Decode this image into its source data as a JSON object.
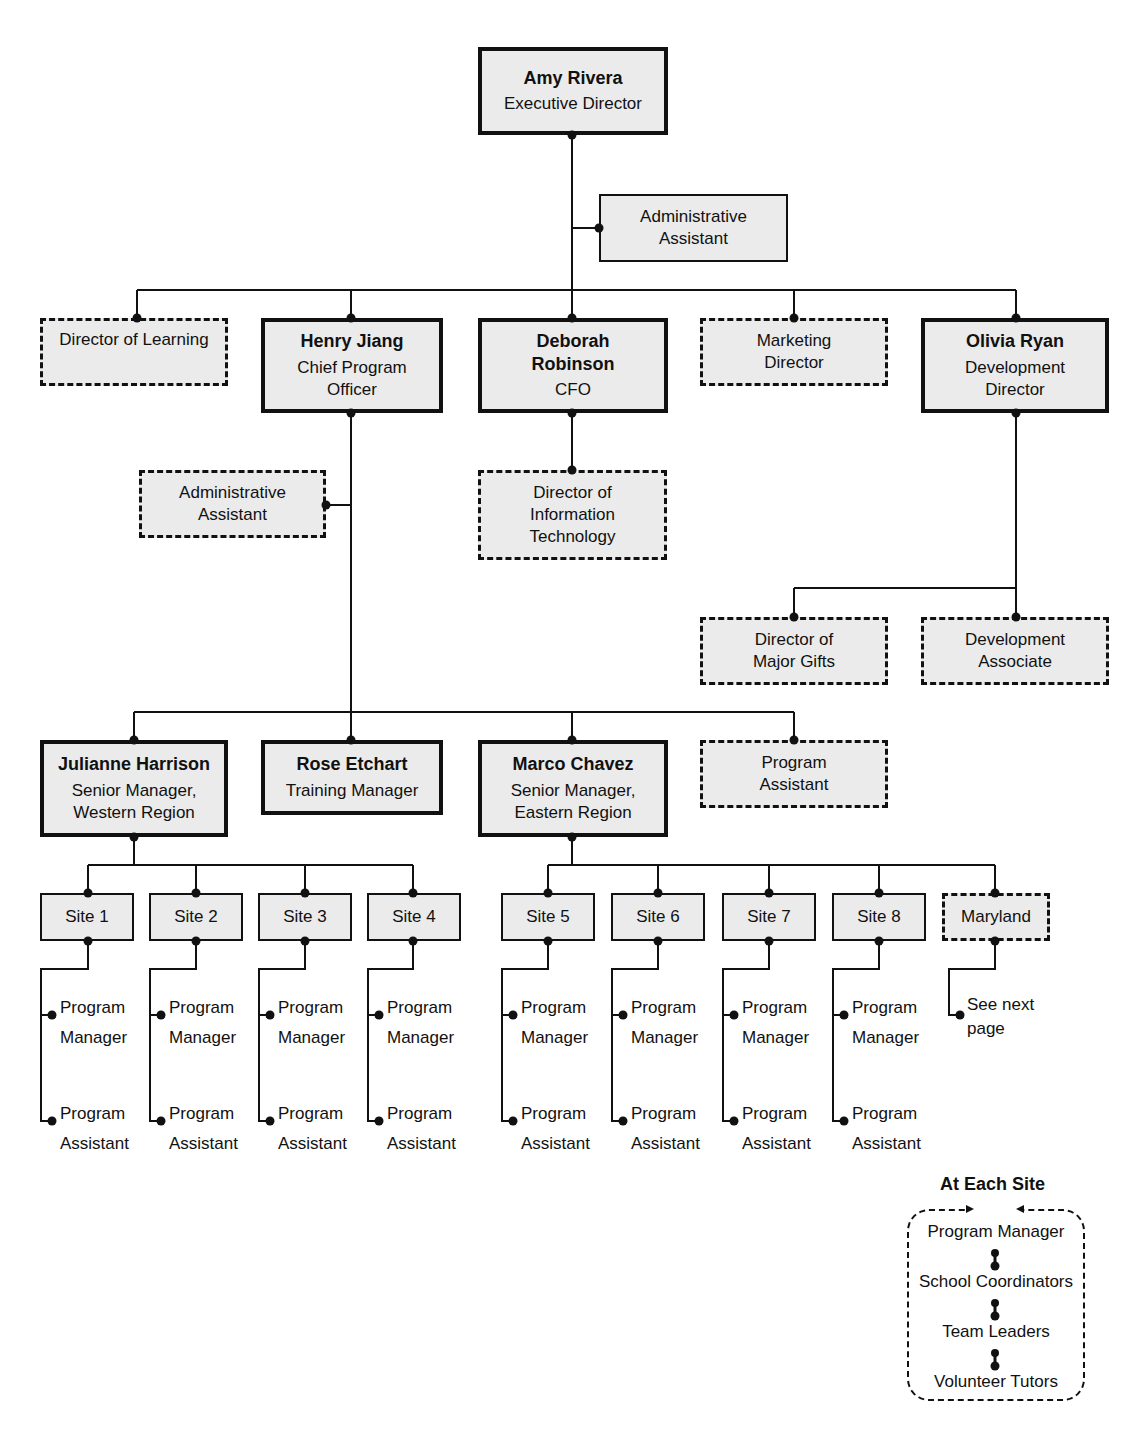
{
  "chart": {
    "boxes": [
      {
        "id": "amy",
        "name": "Amy Rivera",
        "title": [
          "Executive Director"
        ],
        "style": "solid-thick",
        "x": 478,
        "y": 47,
        "w": 190,
        "h": 88
      },
      {
        "id": "admin1",
        "name": "",
        "title": [
          "Administrative",
          "Assistant"
        ],
        "style": "solid-thin",
        "x": 599,
        "y": 194,
        "w": 189,
        "h": 68
      },
      {
        "id": "dol",
        "name": "",
        "title": [
          "Director of Learning"
        ],
        "style": "dashed",
        "x": 40,
        "y": 318,
        "w": 188,
        "h": 68
      },
      {
        "id": "henry",
        "name": "Henry Jiang",
        "title": [
          "Chief Program",
          "Officer"
        ],
        "style": "solid-thick",
        "x": 261,
        "y": 318,
        "w": 182,
        "h": 95
      },
      {
        "id": "deborah",
        "name": "Deborah Robinson",
        "name_lines": [
          "Deborah",
          "Robinson"
        ],
        "title": [
          "CFO"
        ],
        "style": "solid-thick",
        "x": 478,
        "y": 318,
        "w": 190,
        "h": 95
      },
      {
        "id": "mkt",
        "name": "",
        "title": [
          "Marketing",
          "Director"
        ],
        "style": "dashed",
        "x": 700,
        "y": 318,
        "w": 188,
        "h": 68
      },
      {
        "id": "olivia",
        "name": "Olivia Ryan",
        "title": [
          "Development",
          "Director"
        ],
        "style": "solid-thick",
        "x": 921,
        "y": 318,
        "w": 188,
        "h": 95
      },
      {
        "id": "admin2",
        "name": "",
        "title": [
          "Administrative",
          "Assistant"
        ],
        "style": "dashed",
        "x": 139,
        "y": 470,
        "w": 187,
        "h": 68
      },
      {
        "id": "dit",
        "name": "",
        "title": [
          "Director of",
          "Information",
          "Technology"
        ],
        "style": "dashed",
        "x": 478,
        "y": 470,
        "w": 189,
        "h": 90
      },
      {
        "id": "dmg",
        "name": "",
        "title": [
          "Director of",
          "Major Gifts"
        ],
        "style": "dashed",
        "x": 700,
        "y": 617,
        "w": 188,
        "h": 68
      },
      {
        "id": "devassoc",
        "name": "",
        "title": [
          "Development",
          "Associate"
        ],
        "style": "dashed",
        "x": 921,
        "y": 617,
        "w": 188,
        "h": 68
      },
      {
        "id": "julianne",
        "name": "Julianne Harrison",
        "title": [
          "Senior Manager,",
          "Western Region"
        ],
        "style": "solid-thick",
        "x": 40,
        "y": 740,
        "w": 188,
        "h": 97
      },
      {
        "id": "rose",
        "name": "Rose Etchart",
        "title": [
          "Training Manager"
        ],
        "style": "solid-thick",
        "x": 261,
        "y": 740,
        "w": 182,
        "h": 75
      },
      {
        "id": "marco",
        "name": "Marco Chavez",
        "title": [
          "Senior Manager,",
          "Eastern Region"
        ],
        "style": "solid-thick",
        "x": 478,
        "y": 740,
        "w": 190,
        "h": 97
      },
      {
        "id": "pa",
        "name": "",
        "title": [
          "Program",
          "Assistant"
        ],
        "style": "dashed",
        "x": 700,
        "y": 740,
        "w": 188,
        "h": 68
      }
    ],
    "sites": [
      {
        "label": "Site 1",
        "x": 40,
        "y": 893,
        "w": 94,
        "h": 48,
        "style": "solid-thin",
        "cx": 88
      },
      {
        "label": "Site 2",
        "x": 149,
        "y": 893,
        "w": 94,
        "h": 48,
        "style": "solid-thin",
        "cx": 196
      },
      {
        "label": "Site 3",
        "x": 258,
        "y": 893,
        "w": 94,
        "h": 48,
        "style": "solid-thin",
        "cx": 305
      },
      {
        "label": "Site 4",
        "x": 367,
        "y": 893,
        "w": 94,
        "h": 48,
        "style": "solid-thin",
        "cx": 413
      },
      {
        "label": "Site 5",
        "x": 501,
        "y": 893,
        "w": 94,
        "h": 48,
        "style": "solid-thin",
        "cx": 548
      },
      {
        "label": "Site 6",
        "x": 611,
        "y": 893,
        "w": 94,
        "h": 48,
        "style": "solid-thin",
        "cx": 658
      },
      {
        "label": "Site 7",
        "x": 722,
        "y": 893,
        "w": 94,
        "h": 48,
        "style": "solid-thin",
        "cx": 769
      },
      {
        "label": "Site 8",
        "x": 832,
        "y": 893,
        "w": 94,
        "h": 48,
        "style": "solid-thin",
        "cx": 879
      },
      {
        "label": "Maryland",
        "x": 942,
        "y": 893,
        "w": 108,
        "h": 48,
        "style": "dashed",
        "cx": 995
      }
    ],
    "site_staff": [
      {
        "site": "Site 1",
        "manager": [
          "Program",
          "Manager"
        ],
        "assistant": [
          "Program",
          "Assistant"
        ]
      },
      {
        "site": "Site 2",
        "manager": [
          "Program",
          "Manager"
        ],
        "assistant": [
          "Program",
          "Assistant"
        ]
      },
      {
        "site": "Site 3",
        "manager": [
          "Program",
          "Manager"
        ],
        "assistant": [
          "Program",
          "Assistant"
        ]
      },
      {
        "site": "Site 4",
        "manager": [
          "Program",
          "Manager"
        ],
        "assistant": [
          "Program",
          "Assistant"
        ]
      },
      {
        "site": "Site 5",
        "manager": [
          "Program",
          "Manager"
        ],
        "assistant": [
          "Program",
          "Assistant"
        ]
      },
      {
        "site": "Site 6",
        "manager": [
          "Program",
          "Manager"
        ],
        "assistant": [
          "Program",
          "Assistant"
        ]
      },
      {
        "site": "Site 7",
        "manager": [
          "Program",
          "Manager"
        ],
        "assistant": [
          "Program",
          "Assistant"
        ]
      },
      {
        "site": "Site 8",
        "manager": [
          "Program",
          "Manager"
        ],
        "assistant": [
          "Program",
          "Assistant"
        ]
      }
    ],
    "maryland_note": [
      "See next",
      "page"
    ],
    "legend": {
      "title": "At Each Site",
      "items": [
        "Program Manager",
        "School Coordinators",
        "Team Leaders",
        "Volunteer Tutors"
      ]
    }
  }
}
